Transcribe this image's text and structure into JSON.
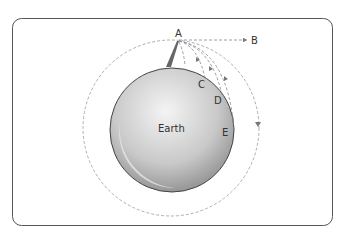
{
  "diagram": {
    "points": {
      "A": "A",
      "B": "B",
      "C": "C",
      "D": "D",
      "E": "E"
    },
    "body_label": "Earth",
    "colors": {
      "frame": "#555555",
      "earth_light": "#f2f2f2",
      "earth_dark": "#8a8a8a",
      "earth_outline": "#444444",
      "dashed": "#888888",
      "tower": "#666666"
    }
  }
}
